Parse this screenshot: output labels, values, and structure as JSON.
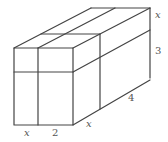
{
  "diagram": {
    "type": "rectangular-prism",
    "colors": {
      "stroke": "#444444",
      "label": "#555555",
      "background": "#ffffff"
    },
    "labels": {
      "front_width_left": "x",
      "front_width_right": "2",
      "depth_front": "x",
      "depth_back": "4",
      "height_top": "x",
      "height_bottom": "3"
    }
  }
}
